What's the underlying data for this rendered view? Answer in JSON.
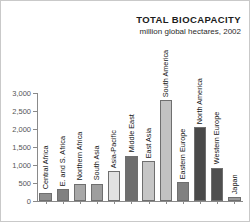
{
  "chart_data": {
    "type": "bar",
    "title": "TOTAL BIOCAPACITY",
    "subtitle": "million global hectares, 2002",
    "xlabel": "",
    "ylabel": "",
    "ylim": [
      0,
      3000
    ],
    "grid": false,
    "legend": "none",
    "ytick_labels": [
      "3,000",
      "2,500",
      "2,000",
      "1,500",
      "1,000",
      "500",
      "0"
    ],
    "ytick_values": [
      3000,
      2500,
      2000,
      1500,
      1000,
      500,
      0
    ],
    "categories": [
      "Central Africa",
      "E. and S. Africa",
      "Northern Africa",
      "South Asia",
      "Asia-Pacific",
      "Middle East",
      "East Asia",
      "South America",
      "Eastern Europe",
      "North America",
      "Western Europe",
      "Japan"
    ],
    "values": [
      230,
      330,
      480,
      480,
      830,
      1260,
      1100,
      2800,
      530,
      2060,
      930,
      100
    ],
    "bar_colors": [
      "#8e8e8e",
      "#808080",
      "#a8a8a8",
      "#9e9e9e",
      "#e2e2e2",
      "#6e6e6e",
      "#c6c6c6",
      "#c2c2c2",
      "#808080",
      "#4a4a4a",
      "#4f4f4f",
      "#9a9a9a"
    ]
  },
  "style": {
    "axis_color": "#8a8a8a",
    "text_color": "#141414",
    "tick_text_color": "#555555",
    "background": "#ffffff"
  }
}
